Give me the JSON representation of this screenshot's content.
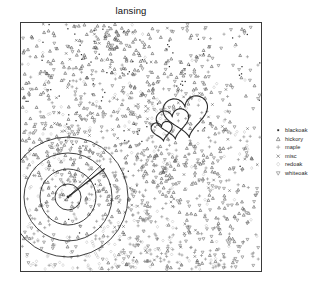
{
  "plot": {
    "title": "lansing",
    "frame": {
      "x": 20,
      "y": 22,
      "width": 242,
      "height": 250
    },
    "background": "#ffffff",
    "frame_color": "#3a3a3a"
  },
  "legend": {
    "position": "right",
    "items": [
      {
        "label": "blackoak",
        "symbol": "filled-square",
        "color": "#2b2b2b"
      },
      {
        "label": "hickory",
        "symbol": "triangle-up",
        "color": "#4a4a4a"
      },
      {
        "label": "maple",
        "symbol": "plus",
        "color": "#8c8c8c"
      },
      {
        "label": "misc",
        "symbol": "cross-x",
        "color": "#5a5a5a"
      },
      {
        "label": "redoak",
        "symbol": "diamond",
        "color": "#bdbdbd"
      },
      {
        "label": "whiteoak",
        "symbol": "triangle-down",
        "color": "#707070"
      }
    ]
  },
  "overlays": [
    {
      "name": "nested-hearts",
      "count": 3,
      "stroke": "#2a2a2a",
      "stroke_width": 1.1
    },
    {
      "name": "concentric-circles",
      "count": 4,
      "stroke": "#2a2a2a",
      "stroke_width": 0.9,
      "center_x": 48,
      "center_y": 175,
      "radii": [
        13,
        28,
        44,
        60
      ]
    },
    {
      "name": "radial-line",
      "stroke": "#2a2a2a",
      "stroke_width": 1.3
    }
  ],
  "chart_data": {
    "type": "scatter",
    "title": "lansing",
    "xlabel": "",
    "ylabel": "",
    "xlim": [
      0,
      1
    ],
    "ylim": [
      0,
      1
    ],
    "grid": false,
    "legend_position": "right",
    "marks": [
      "blackoak",
      "hickory",
      "maple",
      "misc",
      "redoak",
      "whiteoak"
    ],
    "mark_counts": {
      "blackoak": 135,
      "hickory": 703,
      "maple": 514,
      "misc": 105,
      "redoak": 346,
      "whiteoak": 448
    },
    "total_points": 2251,
    "series": [
      {
        "name": "blackoak",
        "symbol": "filled-square",
        "color": "#2b2b2b",
        "n": 135
      },
      {
        "name": "hickory",
        "symbol": "triangle-up",
        "color": "#4a4a4a",
        "n": 703
      },
      {
        "name": "maple",
        "symbol": "plus",
        "color": "#8c8c8c",
        "n": 514
      },
      {
        "name": "misc",
        "symbol": "cross-x",
        "color": "#5a5a5a",
        "n": 105
      },
      {
        "name": "redoak",
        "symbol": "diamond",
        "color": "#bdbdbd",
        "n": 346
      },
      {
        "name": "whiteoak",
        "symbol": "triangle-down",
        "color": "#707070",
        "n": 448
      }
    ]
  }
}
